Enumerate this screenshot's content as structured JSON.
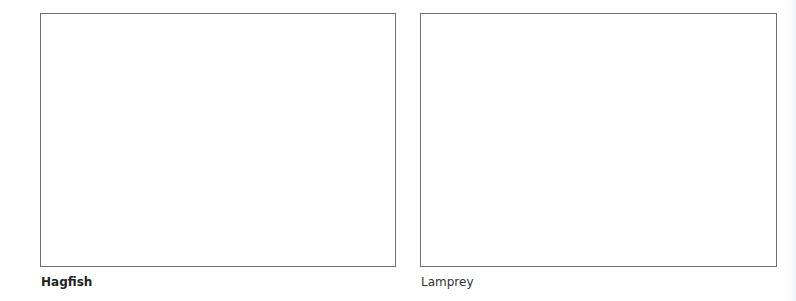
{
  "panels": [
    {
      "id": "hagfish",
      "caption": "Hagfish",
      "caption_weight": "bold",
      "content": ""
    },
    {
      "id": "lamprey",
      "caption": "Lamprey",
      "caption_weight": "normal",
      "content": ""
    }
  ],
  "colors": {
    "border": "#6f6f6f",
    "caption_text": "#222222",
    "background": "#ffffff"
  }
}
